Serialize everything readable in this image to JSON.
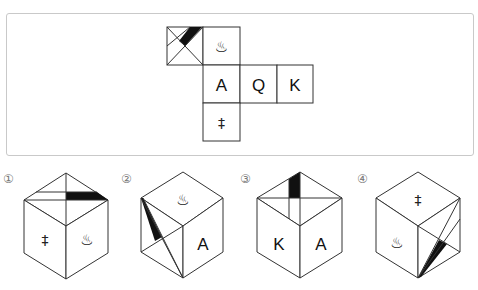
{
  "question": {
    "net": {
      "faces": [
        {
          "id": "stripe-face",
          "content": "diagonal-cross-with-black-stripe"
        },
        {
          "id": "hot-spring-face",
          "symbol": "♨"
        },
        {
          "id": "a-face",
          "symbol": "A"
        },
        {
          "id": "q-face",
          "symbol": "Q"
        },
        {
          "id": "k-face",
          "symbol": "K"
        },
        {
          "id": "cross-face",
          "symbol": "‡"
        }
      ]
    }
  },
  "options": [
    {
      "label": "①",
      "top": "stripe",
      "left": "‡",
      "right": "♨"
    },
    {
      "label": "②",
      "top": "♨",
      "left": "stripe",
      "right": "A"
    },
    {
      "label": "③",
      "top": "stripe",
      "left": "K",
      "right": "A"
    },
    {
      "label": "④",
      "top": "‡",
      "left": "♨",
      "right": "stripe"
    }
  ]
}
